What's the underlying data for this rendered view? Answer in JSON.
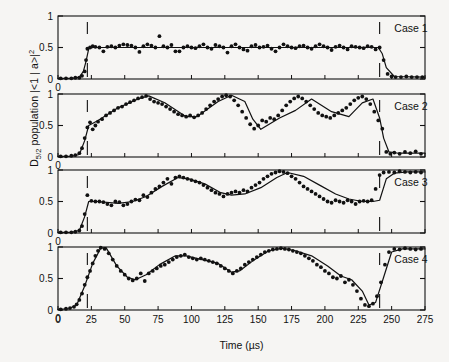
{
  "figure": {
    "background": "#f6f5f3",
    "ink": "#111111",
    "axis_label_y": "D",
    "axis_label_y_sub": "5/2",
    "axis_label_y_rest": " population |<1 | a>|",
    "axis_label_y_sup": "2",
    "axis_label_x": "Time (µs)",
    "panel_count": 4
  },
  "chart_data": {
    "type": "scatter",
    "title": "",
    "xlabel": "Time (µs)",
    "ylabel": "D5/2 population |<1 | a>|^2",
    "xlim": [
      0,
      275
    ],
    "ylim": [
      0,
      1
    ],
    "xticks": [
      0,
      25,
      50,
      75,
      100,
      125,
      150,
      175,
      200,
      225,
      250,
      275
    ],
    "xticklabels": [
      "0",
      "25",
      "50",
      "75",
      "100",
      "125",
      "150",
      "175",
      "200",
      "225",
      "250",
      "275"
    ],
    "yticks": [
      0,
      0.5,
      1
    ],
    "yticklabels": [
      "0",
      "0.5",
      "1"
    ],
    "grid": false,
    "legend": "none",
    "marker": "filled-circle",
    "fit_line": "solid-black",
    "annotations": [
      {
        "type": "vline",
        "x": 22,
        "style": "dashed",
        "note": "pulse start marker"
      },
      {
        "type": "vline",
        "x": 241,
        "style": "dashed",
        "note": "pulse end marker"
      }
    ],
    "panels": [
      {
        "label": "Case 1",
        "label_x": 252,
        "markers": [
          22,
          241
        ],
        "x": [
          2,
          6,
          10,
          13,
          16,
          18,
          20,
          21,
          22,
          24,
          26,
          28,
          31,
          34,
          37,
          40,
          43,
          46,
          49,
          52,
          55,
          58,
          61,
          64,
          67,
          70,
          73,
          76,
          79,
          82,
          85,
          88,
          91,
          94,
          97,
          100,
          103,
          106,
          109,
          112,
          115,
          118,
          121,
          124,
          127,
          130,
          133,
          136,
          139,
          142,
          145,
          148,
          151,
          154,
          157,
          160,
          163,
          166,
          169,
          172,
          175,
          178,
          181,
          184,
          187,
          190,
          193,
          196,
          199,
          202,
          205,
          208,
          211,
          214,
          217,
          220,
          223,
          226,
          229,
          232,
          235,
          238,
          241,
          244,
          247,
          250,
          253,
          257,
          261,
          265,
          269,
          273
        ],
        "y": [
          0.01,
          0.01,
          0.01,
          0.02,
          0.02,
          0.05,
          0.12,
          0.3,
          0.48,
          0.5,
          0.52,
          0.51,
          0.5,
          0.44,
          0.51,
          0.52,
          0.5,
          0.53,
          0.55,
          0.54,
          0.53,
          0.5,
          0.43,
          0.52,
          0.55,
          0.53,
          0.5,
          0.68,
          0.52,
          0.5,
          0.54,
          0.44,
          0.44,
          0.5,
          0.52,
          0.5,
          0.49,
          0.52,
          0.55,
          0.5,
          0.48,
          0.54,
          0.52,
          0.5,
          0.42,
          0.52,
          0.55,
          0.5,
          0.47,
          0.45,
          0.52,
          0.54,
          0.5,
          0.51,
          0.53,
          0.48,
          0.44,
          0.5,
          0.55,
          0.52,
          0.5,
          0.49,
          0.52,
          0.53,
          0.5,
          0.48,
          0.52,
          0.55,
          0.52,
          0.5,
          0.46,
          0.51,
          0.53,
          0.5,
          0.47,
          0.52,
          0.51,
          0.5,
          0.49,
          0.52,
          0.51,
          0.47,
          0.5,
          0.3,
          0.08,
          0.04,
          0.03,
          0.03,
          0.04,
          0.03,
          0.03,
          0.03
        ],
        "fit_x": [
          0,
          10,
          16,
          19,
          21,
          23,
          26,
          40,
          80,
          120,
          160,
          200,
          235,
          240,
          243,
          246,
          252,
          275
        ],
        "fit_y": [
          0.01,
          0.01,
          0.03,
          0.12,
          0.28,
          0.48,
          0.5,
          0.5,
          0.5,
          0.5,
          0.5,
          0.5,
          0.5,
          0.5,
          0.4,
          0.18,
          0.04,
          0.03
        ]
      },
      {
        "label": "Case 2",
        "label_x": 252,
        "markers": [
          22,
          241
        ],
        "x": [
          2,
          6,
          10,
          13,
          16,
          18,
          20,
          22,
          24,
          26,
          28,
          30,
          33,
          36,
          39,
          42,
          45,
          48,
          51,
          54,
          57,
          60,
          63,
          66,
          69,
          72,
          75,
          78,
          81,
          84,
          87,
          90,
          93,
          96,
          99,
          102,
          105,
          108,
          111,
          114,
          117,
          120,
          123,
          126,
          129,
          132,
          135,
          138,
          141,
          144,
          147,
          150,
          153,
          156,
          159,
          162,
          165,
          168,
          171,
          174,
          177,
          180,
          183,
          186,
          189,
          192,
          195,
          198,
          201,
          204,
          207,
          210,
          213,
          216,
          219,
          222,
          225,
          228,
          231,
          234,
          237,
          240,
          243,
          246,
          249,
          252,
          256,
          260,
          264,
          268,
          272
        ],
        "y": [
          0.01,
          0.01,
          0.02,
          0.03,
          0.06,
          0.14,
          0.3,
          0.47,
          0.55,
          0.44,
          0.5,
          0.56,
          0.6,
          0.66,
          0.7,
          0.74,
          0.78,
          0.8,
          0.84,
          0.87,
          0.9,
          0.93,
          0.95,
          0.97,
          0.92,
          0.88,
          0.86,
          0.84,
          0.8,
          0.76,
          0.72,
          0.68,
          0.66,
          0.64,
          0.66,
          0.63,
          0.66,
          0.7,
          0.76,
          0.82,
          0.88,
          0.92,
          0.96,
          0.98,
          0.96,
          0.9,
          0.82,
          0.72,
          0.62,
          0.52,
          0.45,
          0.5,
          0.58,
          0.56,
          0.62,
          0.6,
          0.66,
          0.74,
          0.82,
          0.88,
          0.93,
          0.96,
          0.93,
          0.88,
          0.82,
          0.76,
          0.7,
          0.66,
          0.64,
          0.62,
          0.66,
          0.7,
          0.74,
          0.78,
          0.84,
          0.9,
          0.94,
          0.96,
          0.92,
          0.84,
          0.72,
          0.58,
          0.45,
          0.08,
          0.05,
          0.07,
          0.05,
          0.08,
          0.06,
          0.09,
          0.05
        ],
        "fit_x": [
          0,
          10,
          16,
          20,
          23,
          30,
          45,
          60,
          68,
          80,
          96,
          104,
          120,
          130,
          140,
          146,
          152,
          166,
          178,
          190,
          205,
          218,
          228,
          236,
          241,
          244,
          248,
          255,
          275
        ],
        "fit_y": [
          0.01,
          0.01,
          0.04,
          0.26,
          0.5,
          0.58,
          0.78,
          0.92,
          0.97,
          0.86,
          0.64,
          0.64,
          0.88,
          0.98,
          0.88,
          0.6,
          0.44,
          0.62,
          0.74,
          0.92,
          0.72,
          0.64,
          0.86,
          0.92,
          0.62,
          0.3,
          0.08,
          0.06,
          0.06
        ]
      },
      {
        "label": "Case 3",
        "label_x": 252,
        "markers": [
          22,
          241
        ],
        "x": [
          2,
          6,
          10,
          13,
          16,
          18,
          20,
          22,
          25,
          28,
          31,
          34,
          37,
          40,
          43,
          46,
          49,
          52,
          55,
          58,
          61,
          64,
          67,
          70,
          73,
          76,
          79,
          82,
          85,
          88,
          91,
          94,
          97,
          100,
          103,
          106,
          109,
          112,
          115,
          118,
          121,
          124,
          127,
          130,
          133,
          136,
          139,
          142,
          145,
          148,
          151,
          154,
          157,
          160,
          163,
          166,
          169,
          172,
          175,
          178,
          181,
          184,
          187,
          190,
          193,
          196,
          199,
          202,
          205,
          208,
          211,
          214,
          217,
          220,
          223,
          226,
          229,
          232,
          235,
          238,
          241,
          244,
          248,
          252,
          256,
          260,
          264,
          268,
          272
        ],
        "y": [
          0.01,
          0.01,
          0.01,
          0.02,
          0.04,
          0.11,
          0.3,
          0.6,
          0.51,
          0.5,
          0.5,
          0.49,
          0.46,
          0.44,
          0.5,
          0.49,
          0.44,
          0.46,
          0.5,
          0.53,
          0.52,
          0.6,
          0.57,
          0.64,
          0.7,
          0.74,
          0.8,
          0.86,
          0.78,
          0.88,
          0.9,
          0.88,
          0.86,
          0.84,
          0.82,
          0.8,
          0.76,
          0.72,
          0.68,
          0.64,
          0.62,
          0.58,
          0.62,
          0.64,
          0.66,
          0.64,
          0.68,
          0.66,
          0.72,
          0.76,
          0.8,
          0.86,
          0.9,
          0.94,
          0.96,
          0.98,
          0.97,
          0.95,
          0.9,
          0.86,
          0.8,
          0.74,
          0.7,
          0.66,
          0.62,
          0.58,
          0.54,
          0.5,
          0.48,
          0.52,
          0.5,
          0.48,
          0.52,
          0.5,
          0.46,
          0.5,
          0.51,
          0.5,
          0.52,
          0.7,
          0.92,
          0.96,
          0.97,
          0.96,
          0.98,
          0.97,
          0.96,
          0.97,
          0.96
        ],
        "fit_x": [
          0,
          10,
          16,
          20,
          23,
          30,
          45,
          56,
          66,
          78,
          90,
          98,
          110,
          122,
          130,
          140,
          152,
          164,
          172,
          184,
          196,
          208,
          218,
          228,
          236,
          241,
          246,
          252,
          262,
          275
        ],
        "fit_y": [
          0.01,
          0.01,
          0.04,
          0.26,
          0.5,
          0.5,
          0.47,
          0.5,
          0.58,
          0.74,
          0.88,
          0.86,
          0.78,
          0.64,
          0.6,
          0.62,
          0.72,
          0.88,
          0.96,
          0.9,
          0.76,
          0.62,
          0.54,
          0.5,
          0.5,
          0.52,
          0.86,
          0.95,
          0.97,
          0.97
        ]
      },
      {
        "label": "Case 4",
        "label_x": 252,
        "markers": [
          22,
          241
        ],
        "x": [
          2,
          6,
          9,
          12,
          14,
          16,
          18,
          20,
          22,
          24,
          26,
          28,
          30,
          32,
          35,
          38,
          41,
          44,
          47,
          50,
          53,
          56,
          59,
          62,
          65,
          68,
          71,
          74,
          77,
          80,
          83,
          86,
          89,
          92,
          95,
          98,
          101,
          104,
          107,
          110,
          113,
          116,
          119,
          122,
          125,
          128,
          131,
          134,
          137,
          140,
          143,
          146,
          149,
          152,
          155,
          158,
          161,
          164,
          167,
          170,
          173,
          176,
          179,
          182,
          185,
          188,
          191,
          194,
          197,
          200,
          203,
          206,
          209,
          212,
          215,
          218,
          221,
          224,
          227,
          230,
          233,
          236,
          239,
          242,
          245,
          248,
          252,
          256,
          260,
          264,
          268,
          272
        ],
        "y": [
          0.01,
          0.02,
          0.03,
          0.05,
          0.09,
          0.16,
          0.26,
          0.4,
          0.52,
          0.62,
          0.74,
          0.86,
          0.94,
          0.99,
          0.97,
          0.9,
          0.8,
          0.7,
          0.62,
          0.56,
          0.5,
          0.47,
          0.5,
          0.58,
          0.46,
          0.58,
          0.62,
          0.66,
          0.7,
          0.72,
          0.76,
          0.8,
          0.84,
          0.86,
          0.88,
          0.84,
          0.82,
          0.8,
          0.82,
          0.8,
          0.78,
          0.76,
          0.74,
          0.7,
          0.66,
          0.62,
          0.58,
          0.62,
          0.66,
          0.72,
          0.76,
          0.8,
          0.84,
          0.88,
          0.92,
          0.94,
          0.96,
          0.97,
          0.98,
          0.97,
          0.96,
          0.94,
          0.92,
          0.9,
          0.86,
          0.82,
          0.78,
          0.72,
          0.68,
          0.62,
          0.58,
          0.52,
          0.5,
          0.54,
          0.44,
          0.48,
          0.4,
          0.3,
          0.18,
          0.08,
          0.06,
          0.1,
          0.22,
          0.44,
          0.72,
          0.92,
          0.97,
          0.96,
          0.98,
          0.97,
          0.96,
          0.97
        ],
        "fit_x": [
          0,
          8,
          14,
          20,
          26,
          32,
          36,
          44,
          52,
          58,
          66,
          76,
          88,
          96,
          108,
          120,
          130,
          136,
          146,
          158,
          168,
          178,
          190,
          202,
          212,
          220,
          228,
          233,
          238,
          244,
          250,
          258,
          275
        ],
        "fit_y": [
          0.01,
          0.02,
          0.08,
          0.38,
          0.74,
          0.98,
          0.99,
          0.7,
          0.52,
          0.48,
          0.56,
          0.72,
          0.86,
          0.86,
          0.8,
          0.74,
          0.6,
          0.62,
          0.78,
          0.94,
          0.98,
          0.94,
          0.86,
          0.7,
          0.54,
          0.48,
          0.3,
          0.08,
          0.12,
          0.52,
          0.92,
          0.97,
          0.97
        ]
      }
    ]
  }
}
